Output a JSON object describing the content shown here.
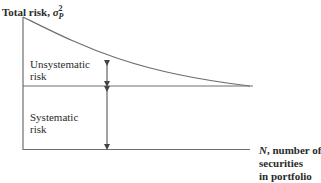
{
  "title": {
    "text": "Total risk, ",
    "symbol": "σ",
    "subscript": "P",
    "superscript": "2"
  },
  "labels": {
    "unsystematic": [
      "Unsystematic",
      "risk"
    ],
    "systematic": [
      "Systematic",
      "risk"
    ]
  },
  "x_axis_label": {
    "var": "N",
    "line1": ", number of",
    "line2": "securities",
    "line3": "in portfolio"
  },
  "colors": {
    "line": "#6f6f6f",
    "text": "#2a2a2a"
  }
}
